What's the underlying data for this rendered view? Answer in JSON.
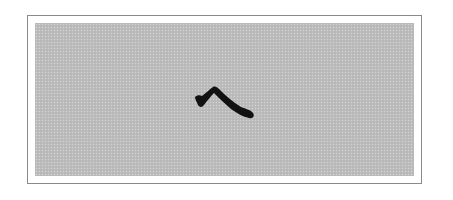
{
  "figure": {
    "type": "scanned-illustration",
    "glyph": "乀",
    "glyph_description": "single brush stroke resembling a caret / katakana he",
    "colors": {
      "page_background": "#ffffff",
      "frame_border": "#8a8a8a",
      "panel_fill": "#bdbdbd",
      "stroke_ink": "#111111"
    }
  }
}
